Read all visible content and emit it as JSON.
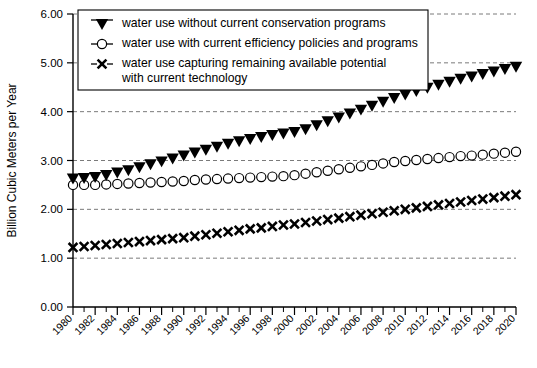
{
  "chart_data": {
    "type": "scatter",
    "title": "",
    "xlabel": "",
    "ylabel": "Billion Cubic Meters per Year",
    "xlim": [
      1980,
      2020
    ],
    "ylim": [
      0.0,
      6.0
    ],
    "y_ticks": [
      "0.00",
      "1.00",
      "2.00",
      "3.00",
      "4.00",
      "5.00",
      "6.00"
    ],
    "y_tick_values": [
      0,
      1,
      2,
      3,
      4,
      5,
      6
    ],
    "grid": "horizontal dashed gridlines at 1.00 through 5.00",
    "legend_position": "top-left inside plot area",
    "x_tick_labels": [
      "1980",
      "1982",
      "1984",
      "1986",
      "1988",
      "1990",
      "1992",
      "1994",
      "1996",
      "1998",
      "2000",
      "2002",
      "2004",
      "2006",
      "2008",
      "2010",
      "2012",
      "2014",
      "2016",
      "2018",
      "2020"
    ],
    "x": [
      1980,
      1981,
      1982,
      1983,
      1984,
      1985,
      1986,
      1987,
      1988,
      1989,
      1990,
      1991,
      1992,
      1993,
      1994,
      1995,
      1996,
      1997,
      1998,
      1999,
      2000,
      2001,
      2002,
      2003,
      2004,
      2005,
      2006,
      2007,
      2008,
      2009,
      2010,
      2011,
      2012,
      2013,
      2014,
      2015,
      2016,
      2017,
      2018,
      2019,
      2020
    ],
    "series": [
      {
        "name": "water use without current conservation programs",
        "marker": "filled-triangle-down",
        "values": [
          2.63,
          2.64,
          2.66,
          2.7,
          2.75,
          2.8,
          2.86,
          2.92,
          2.98,
          3.04,
          3.1,
          3.16,
          3.22,
          3.28,
          3.34,
          3.39,
          3.44,
          3.48,
          3.52,
          3.55,
          3.58,
          3.64,
          3.72,
          3.8,
          3.88,
          3.96,
          4.04,
          4.12,
          4.2,
          4.28,
          4.35,
          4.42,
          4.49,
          4.55,
          4.61,
          4.67,
          4.72,
          4.77,
          4.82,
          4.87,
          4.92
        ]
      },
      {
        "name": "water use with current efficiency policies and programs",
        "marker": "open-circle",
        "values": [
          2.5,
          2.5,
          2.5,
          2.51,
          2.52,
          2.53,
          2.54,
          2.55,
          2.56,
          2.57,
          2.58,
          2.6,
          2.61,
          2.62,
          2.63,
          2.64,
          2.65,
          2.66,
          2.67,
          2.68,
          2.7,
          2.73,
          2.76,
          2.79,
          2.82,
          2.85,
          2.88,
          2.91,
          2.94,
          2.97,
          2.99,
          3.01,
          3.03,
          3.05,
          3.07,
          3.09,
          3.1,
          3.12,
          3.14,
          3.16,
          3.18
        ]
      },
      {
        "name": "water use capturing remaining available potential with current technology",
        "marker": "x-cross",
        "values": [
          1.22,
          1.24,
          1.26,
          1.28,
          1.3,
          1.32,
          1.34,
          1.36,
          1.38,
          1.4,
          1.42,
          1.45,
          1.48,
          1.51,
          1.54,
          1.57,
          1.6,
          1.62,
          1.65,
          1.68,
          1.7,
          1.73,
          1.76,
          1.79,
          1.82,
          1.85,
          1.88,
          1.91,
          1.94,
          1.97,
          2.0,
          2.03,
          2.06,
          2.09,
          2.12,
          2.15,
          2.18,
          2.21,
          2.24,
          2.27,
          2.3
        ]
      }
    ],
    "legend": [
      {
        "marker": "filled-triangle-down",
        "lines": [
          "water use without current conservation programs"
        ]
      },
      {
        "marker": "open-circle",
        "lines": [
          "water use with current efficiency policies and programs"
        ]
      },
      {
        "marker": "x-cross",
        "lines": [
          "water use capturing remaining available potential",
          "with current technology"
        ]
      }
    ],
    "colors": {
      "marker": "#000000",
      "axis": "#000000",
      "gridline": "#6b6b6b",
      "background": "#ffffff"
    }
  }
}
